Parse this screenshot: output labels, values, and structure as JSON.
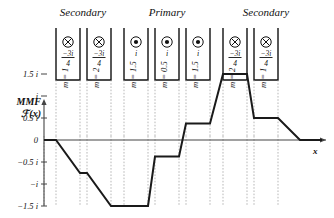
{
  "figure": {
    "title_mmf_line1": "MMF",
    "title_mmf_line2": "ℱ(x)",
    "x_axis_label": "x"
  },
  "groups": [
    {
      "label": "Secondary",
      "center_x": 83
    },
    {
      "label": "Primary",
      "center_x": 167
    },
    {
      "label": "Secondary",
      "center_x": 266
    }
  ],
  "slots": [
    {
      "index": 1,
      "group": "Secondary",
      "polarity": "into-page",
      "icon": "cross-in-circle",
      "current_numerator": "−3i",
      "current_denominator": "4",
      "current_display": "−3i/4",
      "turns_label": "m = 1",
      "turns": 1,
      "x_left": 56,
      "x_right": 80
    },
    {
      "index": 2,
      "group": "Secondary",
      "polarity": "into-page",
      "icon": "cross-in-circle",
      "current_numerator": "−3i",
      "current_denominator": "4",
      "current_display": "−3i/4",
      "turns_label": "m = 2",
      "turns": 2,
      "x_left": 87,
      "x_right": 111
    },
    {
      "index": 3,
      "group": "Primary",
      "polarity": "out-of-page",
      "icon": "dot-in-circle",
      "current_numerator": "i",
      "current_denominator": "",
      "current_display": "i",
      "turns_label": "m = 1.5",
      "turns": 1.5,
      "x_left": 124,
      "x_right": 148
    },
    {
      "index": 4,
      "group": "Primary",
      "polarity": "out-of-page",
      "icon": "dot-in-circle",
      "current_numerator": "i",
      "current_denominator": "",
      "current_display": "i",
      "turns_label": "m = 0.5",
      "turns": 0.5,
      "x_left": 155,
      "x_right": 179
    },
    {
      "index": 5,
      "group": "Primary",
      "polarity": "out-of-page",
      "icon": "dot-in-circle",
      "current_numerator": "i",
      "current_denominator": "",
      "current_display": "i",
      "turns_label": "m = 1.5",
      "turns": 1.5,
      "x_left": 186,
      "x_right": 210
    },
    {
      "index": 6,
      "group": "Secondary",
      "polarity": "into-page",
      "icon": "cross-in-circle",
      "current_numerator": "−3i",
      "current_denominator": "4",
      "current_display": "−3i/4",
      "turns_label": "m = 2",
      "turns": 2,
      "x_left": 223,
      "x_right": 247
    },
    {
      "index": 7,
      "group": "Secondary",
      "polarity": "into-page",
      "icon": "cross-in-circle",
      "current_numerator": "−3i",
      "current_denominator": "4",
      "current_display": "−3i/4",
      "turns_label": "m = 1",
      "turns": 1,
      "x_left": 254,
      "x_right": 278
    }
  ],
  "chart_data": {
    "type": "line",
    "title": "",
    "xlabel": "x",
    "ylabel": "ℱ(x)",
    "ylim": [
      -1.5,
      1.5
    ],
    "ytick_labels": [
      "1.5 i",
      "i",
      "0.5 i",
      "0",
      "−0.5 i",
      "−i",
      "−1.5 i"
    ],
    "ytick_values": [
      1.5,
      1,
      0.5,
      0,
      -0.5,
      -1,
      -1.5
    ],
    "grid": true,
    "legend": "none",
    "series": [
      {
        "name": "MMF staircase",
        "points": [
          {
            "x": 44,
            "y": 0
          },
          {
            "x": 56,
            "y": 0
          },
          {
            "x": 80,
            "y": -0.75
          },
          {
            "x": 87,
            "y": -0.75
          },
          {
            "x": 111,
            "y": -1.5
          },
          {
            "x": 148,
            "y": -1.5
          },
          {
            "x": 155,
            "y": -0.375
          },
          {
            "x": 179,
            "y": -0.375
          },
          {
            "x": 186,
            "y": 0.375
          },
          {
            "x": 210,
            "y": 0.375
          },
          {
            "x": 223,
            "y": 1.5
          },
          {
            "x": 247,
            "y": 1.5
          },
          {
            "x": 254,
            "y": 0.5
          },
          {
            "x": 278,
            "y": 0.5
          },
          {
            "x": 300,
            "y": 0
          },
          {
            "x": 322,
            "y": 0
          }
        ]
      }
    ],
    "gridline_x": [
      44,
      56,
      80,
      87,
      111,
      124,
      148,
      155,
      179,
      186,
      210,
      223,
      247,
      254,
      278
    ]
  }
}
